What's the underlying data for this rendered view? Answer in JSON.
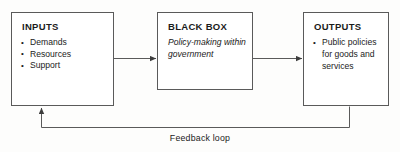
{
  "diagram": {
    "line_color": "#5a5a5a",
    "text_color": "#1b1b1b",
    "background": "#fdfdfc",
    "boxes": [
      {
        "id": "inputs",
        "title": "INPUTS",
        "items": [
          "Demands",
          "Resources",
          "Support"
        ]
      },
      {
        "id": "black-box",
        "title": "BLACK BOX",
        "body": "Policy-making within government"
      },
      {
        "id": "outputs",
        "title": "OUTPUTS",
        "items": [
          "Public policies for goods and services"
        ]
      }
    ],
    "connectors": {
      "inputs_to_blackbox": "arrow-right",
      "blackbox_to_outputs": "arrow-right",
      "feedback": "arrow-up"
    },
    "feedback_label": "Feedback loop"
  }
}
